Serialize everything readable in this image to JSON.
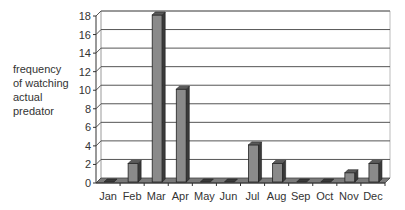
{
  "chart_data": {
    "type": "bar",
    "style": "3d-column",
    "title": "",
    "xlabel": "",
    "ylabel": "frequency of watching actual predator",
    "ylabel_lines": [
      "frequency",
      "of watching",
      "actual",
      "predator"
    ],
    "categories": [
      "Jan",
      "Feb",
      "Mar",
      "Apr",
      "May",
      "Jun",
      "Jul",
      "Aug",
      "Sep",
      "Oct",
      "Nov",
      "Dec"
    ],
    "values": [
      0,
      2,
      18,
      10,
      0,
      0,
      4,
      2,
      0,
      0,
      1,
      2
    ],
    "ylim": [
      0,
      18
    ],
    "yticks": [
      0,
      2,
      4,
      6,
      8,
      10,
      12,
      14,
      16,
      18
    ],
    "grid": true,
    "legend": null
  },
  "colors": {
    "bar_front": "#8a8a8a",
    "bar_side": "#3a3a3a",
    "bar_top": "#5a5a5a",
    "grid": "#555555",
    "floor": "#7a7a7a"
  }
}
